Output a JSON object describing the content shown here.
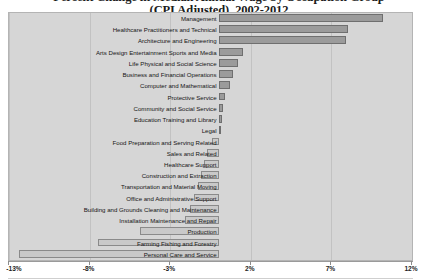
{
  "chart": {
    "title_line1": "Percent Change in Median Annual Wage by Occupation Group",
    "title_line2": "(CPI Adjusted), 2002-2012"
  },
  "chart_data": {
    "type": "bar",
    "orientation": "horizontal",
    "title": "Percent Change in Median Annual Wage by Occupation Group (CPI Adjusted), 2002-2012",
    "xlabel": "",
    "ylabel": "",
    "xlim": [
      -13,
      12
    ],
    "xticks": [
      -13,
      -8,
      -3,
      2,
      7,
      12
    ],
    "xtick_labels": [
      "-13%",
      "-8%",
      "-3%",
      "2%",
      "7%",
      "12%"
    ],
    "grid": true,
    "legend": "none",
    "categories": [
      "Management",
      "Healthcare Practitioners and Technical",
      "Architecture and Engineering",
      "Arts Design Entertainment Sports and Media",
      "Life Physical and Social Science",
      "Business and Financial Operations",
      "Computer and Mathematical",
      "Protective Service",
      "Community and Social Service",
      "Education Training and Library",
      "Legal",
      "Food Preparation and Serving Related",
      "Sales and Related",
      "Healthcare Support",
      "Construction and Extraction",
      "Transportation and Material Moving",
      "Office and Administrative Support",
      "Building and Grounds Cleaning and Maintenance",
      "Installation Maintenance and Repair",
      "Production",
      "Farming Fishing and Forestry",
      "Personal Care and Service"
    ],
    "values": [
      10.2,
      8.0,
      7.9,
      1.5,
      1.2,
      0.9,
      0.7,
      0.4,
      0.3,
      0.2,
      0.1,
      -0.4,
      -0.7,
      -0.9,
      -1.1,
      -1.3,
      -1.5,
      -1.8,
      -2.1,
      -4.9,
      -7.5,
      -12.4
    ]
  }
}
